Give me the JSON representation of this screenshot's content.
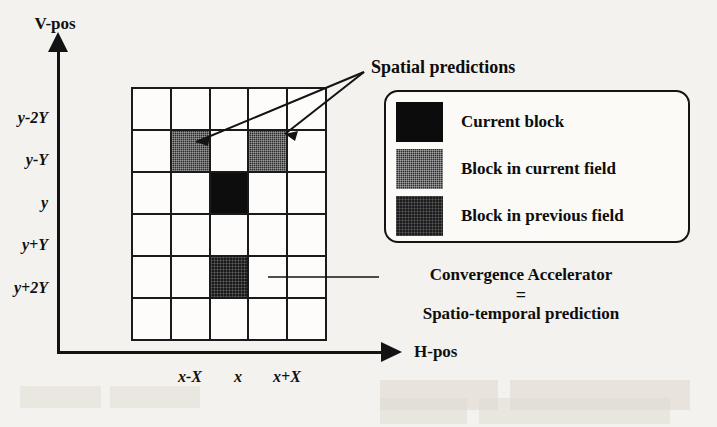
{
  "figure": {
    "type": "diagram"
  },
  "axes": {
    "vertical": {
      "title": "V-pos",
      "arrow": "up-arrow-icon",
      "ticks": [
        "y-2Y",
        "y-Y",
        "y",
        "y+Y",
        "y+2Y"
      ]
    },
    "horizontal": {
      "title": "H-pos",
      "arrow": "right-arrow-icon",
      "ticks": [
        "x-X",
        "x",
        "x+X"
      ]
    }
  },
  "grid": {
    "columns": 5,
    "rows": 6,
    "cells": [
      [
        "empty",
        "empty",
        "empty",
        "empty",
        "empty"
      ],
      [
        "empty",
        "curfield",
        "empty",
        "curfield",
        "empty"
      ],
      [
        "empty",
        "empty",
        "current",
        "empty",
        "empty"
      ],
      [
        "empty",
        "empty",
        "empty",
        "empty",
        "empty"
      ],
      [
        "empty",
        "empty",
        "prevfield",
        "empty",
        "empty"
      ],
      [
        "empty",
        "empty",
        "empty",
        "empty",
        "empty"
      ]
    ]
  },
  "annotations": {
    "spatial_predictions": "Spatial predictions",
    "convergence": {
      "line1": "Convergence Accelerator",
      "line2": "=",
      "line3": "Spatio-temporal prediction"
    }
  },
  "legend": {
    "items": [
      {
        "swatch": "current",
        "label": "Current block"
      },
      {
        "swatch": "curfield",
        "label": "Block in current field"
      },
      {
        "swatch": "prevfield",
        "label": "Block in previous field"
      }
    ]
  },
  "colors": {
    "current_block": "#0c0c0c",
    "block_current_field": "#2e2e2e",
    "block_previous_field": "#1c1c1c",
    "ink": "#101010",
    "paper": "#f4f2ee"
  },
  "ghost_text": {
    "top": "the faded bleed-through text of the scanned page above",
    "bottom": "faint scanned text below the figure"
  }
}
